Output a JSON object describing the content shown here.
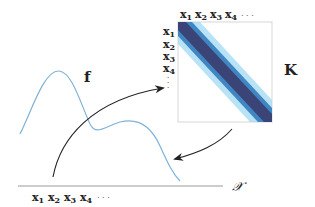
{
  "diagram": {
    "function_label": "f",
    "matrix_label": "K",
    "domain_label": "𝒳",
    "axis_points": [
      "x",
      "x",
      "x",
      "x"
    ],
    "axis_subscripts": [
      "1",
      "2",
      "3",
      "4"
    ],
    "ellipsis": "· · ·",
    "matrix_col_labels": [
      "x1",
      "x2",
      "x3",
      "x4"
    ],
    "matrix_row_labels": [
      "x1",
      "x2",
      "x3",
      "x4"
    ],
    "colors": {
      "function_curve": "#7fb2d8",
      "arrow": "#222222",
      "axis": "#999999",
      "matrix_dark": "#3a4476",
      "matrix_mid": "#3aa8e0",
      "matrix_light": "#ffffff"
    }
  }
}
